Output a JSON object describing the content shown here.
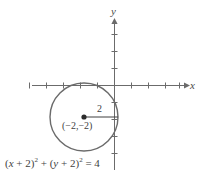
{
  "figure": {
    "kind": "analytic-geometry-diagram",
    "background_color": "#ffffff",
    "line_color": "#6b6b6b",
    "text_color": "#3f3f3f"
  },
  "axes": {
    "x_label": "x",
    "y_label": "y",
    "origin_px": {
      "x": 114,
      "y": 85
    },
    "unit_px": 17,
    "x_tick_count_left": 5,
    "x_tick_count_right": 4,
    "y_tick_count_up": 3,
    "y_tick_count_down": 4,
    "x_axis_start_px": 32,
    "x_axis_end_px": 188,
    "y_axis_start_px": 18,
    "y_axis_end_px": 170,
    "arrow_x": true,
    "arrow_y": true,
    "tick_half_len_px": 3
  },
  "circle": {
    "center": {
      "x": -2,
      "y": -2
    },
    "center_label": "(−2,−2)",
    "radius": 2,
    "radius_label": "2",
    "center_px": {
      "x": 84,
      "y": 117
    },
    "radius_px": 34,
    "center_dot_radius_px": 2.6,
    "stroke_width": 1.4
  },
  "equation": {
    "lhs_1_open": "(",
    "lhs_1_var": "x",
    "lhs_1_op": " + ",
    "lhs_1_num": "2",
    "lhs_1_close": ")",
    "lhs_1_exp": "2",
    "plus": " + ",
    "lhs_2_open": "(",
    "lhs_2_var": "y",
    "lhs_2_op": " + ",
    "lhs_2_num": "2",
    "lhs_2_close": ")",
    "lhs_2_exp": "2",
    "equals": " = ",
    "rhs": "4",
    "plain_text": "(x + 2)² + (y + 2)² = 4"
  }
}
